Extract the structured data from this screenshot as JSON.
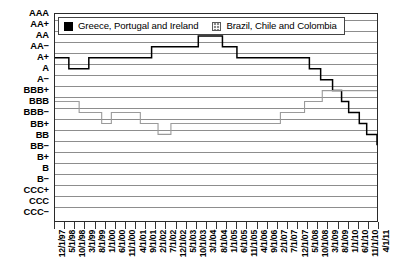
{
  "chart_data": {
    "type": "line",
    "title": "",
    "xlabel": "",
    "ylabel": "",
    "grid": true,
    "legend_position": "top-left-inside",
    "y_categories": [
      "AAA",
      "AA+",
      "AA",
      "AA−",
      "A+",
      "A",
      "A−",
      "BBB+",
      "BBB",
      "BBB−",
      "BB+",
      "BB",
      "BB−",
      "B+",
      "B",
      "B−",
      "CCC+",
      "CCC",
      "CCC−"
    ],
    "ylim": [
      "CCC−",
      "AAA"
    ],
    "x": [
      "12/1/97",
      "5/1/98",
      "10/1/98",
      "3/1/99",
      "8/1/99",
      "1/1/00",
      "6/1/00",
      "11/1/00",
      "4/1/01",
      "9/1/01",
      "2/1/02",
      "7/1/02",
      "12/1/02",
      "5/1/03",
      "10/1/03",
      "3/1/04",
      "8/1/04",
      "1/1/05",
      "6/1/05",
      "11/1/05",
      "4/1/06",
      "9/1/06",
      "2/1/07",
      "7/1/07",
      "12/1/07",
      "5/1/08",
      "10/1/08",
      "3/1/09",
      "8/1/09",
      "1/1/10",
      "6/1/10",
      "11/1/10",
      "4/1/11"
    ],
    "series": [
      {
        "name": "Greece, Portugal and Ireland",
        "color": "#000000",
        "swatch": "sw-black",
        "steps": [
          {
            "t": 0.0,
            "rating": "A+"
          },
          {
            "t": 0.043,
            "rating": "A"
          },
          {
            "t": 0.105,
            "rating": "A+"
          },
          {
            "t": 0.3,
            "rating": "AA−"
          },
          {
            "t": 0.445,
            "rating": "AA"
          },
          {
            "t": 0.52,
            "rating": "AA−"
          },
          {
            "t": 0.565,
            "rating": "A+"
          },
          {
            "t": 0.79,
            "rating": "A"
          },
          {
            "t": 0.825,
            "rating": "A−"
          },
          {
            "t": 0.862,
            "rating": "BBB+"
          },
          {
            "t": 0.89,
            "rating": "BBB"
          },
          {
            "t": 0.912,
            "rating": "BBB−"
          },
          {
            "t": 0.945,
            "rating": "BB+"
          },
          {
            "t": 0.968,
            "rating": "BB"
          },
          {
            "t": 1.0,
            "rating": "BB−"
          }
        ]
      },
      {
        "name": "Brazil, Chile and Colombia",
        "color": "#9a9a9a",
        "swatch": "sw-gray",
        "steps": [
          {
            "t": 0.0,
            "rating": "BBB"
          },
          {
            "t": 0.075,
            "rating": "BBB−"
          },
          {
            "t": 0.145,
            "rating": "BB+"
          },
          {
            "t": 0.175,
            "rating": "BBB−"
          },
          {
            "t": 0.265,
            "rating": "BB+"
          },
          {
            "t": 0.32,
            "rating": "BB"
          },
          {
            "t": 0.36,
            "rating": "BB+"
          },
          {
            "t": 0.7,
            "rating": "BBB−"
          },
          {
            "t": 0.775,
            "rating": "BBB"
          },
          {
            "t": 0.83,
            "rating": "BBB+"
          },
          {
            "t": 1.0,
            "rating": "BBB+"
          }
        ]
      }
    ]
  }
}
